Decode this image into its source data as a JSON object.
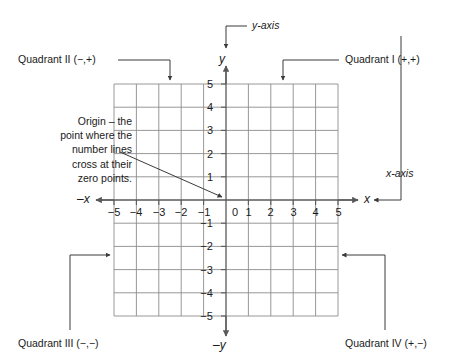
{
  "diagram": {
    "colors": {
      "grid_line": "#8c8c8c",
      "axis_line": "#5a5a5a",
      "leader_line": "#3a3a3a",
      "text": "#1a1a1a",
      "background": "#ffffff"
    },
    "grid": {
      "x_min": -5,
      "x_max": 5,
      "y_min": -5,
      "y_max": 5,
      "cell_size_px": 22.4
    },
    "axis_labels": {
      "y_axis_callout": "y-axis",
      "x_axis_callout": "x-axis",
      "y_positive": "y",
      "y_negative": "–y",
      "x_positive": "x",
      "x_negative": "–x"
    },
    "quadrants": [
      {
        "name": "quadrant-1",
        "label": "Quadrant I (+,+)"
      },
      {
        "name": "quadrant-2",
        "label": "Quadrant II (−,+)"
      },
      {
        "name": "quadrant-3",
        "label": "Quadrant III (−,−)"
      },
      {
        "name": "quadrant-4",
        "label": "Quadrant IV (+,−)"
      }
    ],
    "origin_note": {
      "lines": [
        "Origin – the",
        "point where the",
        "number lines",
        "cross at their",
        "zero points."
      ],
      "text": "Origin – the point where the number lines cross at their zero points."
    },
    "x_ticks": {
      "negative": [
        "−5",
        "−4",
        "−3",
        "−2",
        "−1"
      ],
      "zero": "0",
      "positive": [
        "1",
        "2",
        "3",
        "4",
        "5"
      ]
    },
    "y_ticks": {
      "positive": [
        "1",
        "2",
        "3",
        "4",
        "5"
      ],
      "negative": [
        "−1",
        "−2",
        "−3",
        "−4",
        "−5"
      ]
    }
  }
}
